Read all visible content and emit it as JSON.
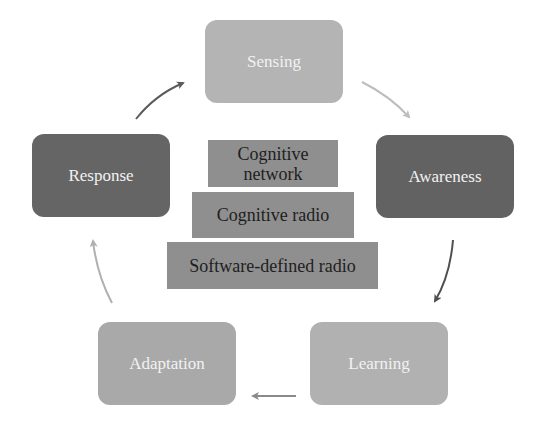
{
  "diagram": {
    "cycle": [
      {
        "id": "sensing",
        "label": "Sensing",
        "color": "#b4b4b4"
      },
      {
        "id": "awareness",
        "label": "Awareness",
        "color": "#626262"
      },
      {
        "id": "learning",
        "label": "Learning",
        "color": "#b1b1b1"
      },
      {
        "id": "adaptation",
        "label": "Adaptation",
        "color": "#a9a9a9"
      },
      {
        "id": "response",
        "label": "Response",
        "color": "#656565"
      }
    ],
    "stack": [
      {
        "id": "cognitive-network",
        "label": "Cognitive network"
      },
      {
        "id": "cognitive-radio",
        "label": "Cognitive radio"
      },
      {
        "id": "software-defined-radio",
        "label": "Software-defined radio"
      }
    ],
    "stack_color": "#8f8f8f",
    "arrows": [
      {
        "from": "Response",
        "to": "Sensing",
        "color": "#5a5a5a"
      },
      {
        "from": "Sensing",
        "to": "Awareness",
        "color": "#bdbdbd"
      },
      {
        "from": "Awareness",
        "to": "Learning",
        "color": "#505050"
      },
      {
        "from": "Learning",
        "to": "Adaptation",
        "color": "#8a8a8a"
      },
      {
        "from": "Adaptation",
        "to": "Response",
        "color": "#b0b0b0"
      }
    ]
  }
}
